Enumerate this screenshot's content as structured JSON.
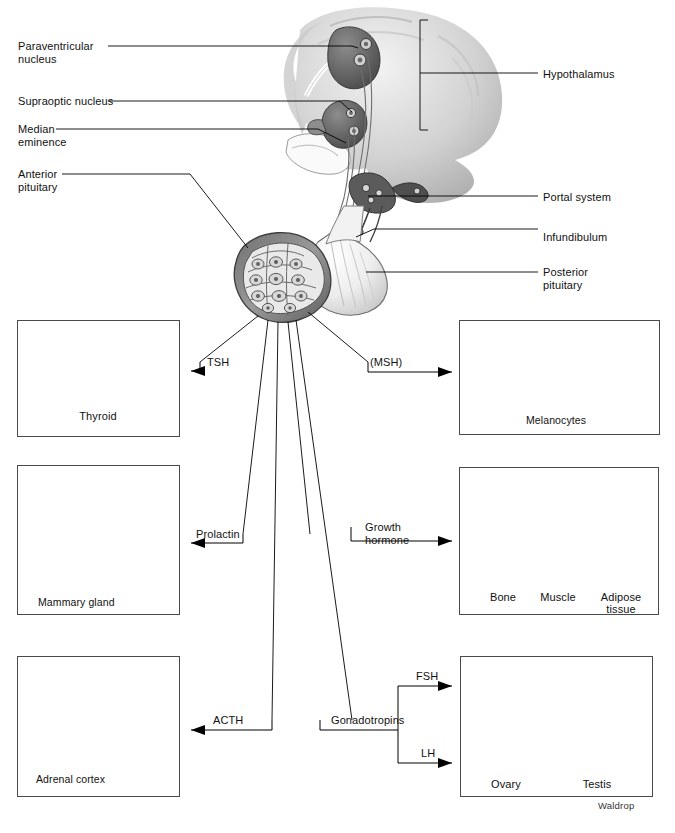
{
  "figure": {
    "credit": "Waldrop"
  },
  "anatomy_labels": {
    "left": [
      {
        "name": "paraventricular-nucleus",
        "text": "Paraventricular\nnucleus",
        "x": 18,
        "y": 40
      },
      {
        "name": "supraoptic-nucleus",
        "text": "Supraoptic nucleus",
        "x": 18,
        "y": 95
      },
      {
        "name": "median-eminence",
        "text": "Median\neminence",
        "x": 18,
        "y": 123
      },
      {
        "name": "anterior-pituitary",
        "text": "Anterior\npituitary",
        "x": 18,
        "y": 168
      }
    ],
    "right": [
      {
        "name": "hypothalamus",
        "text": "Hypothalamus",
        "x": 543,
        "y": 68
      },
      {
        "name": "portal-system",
        "text": "Portal system",
        "x": 543,
        "y": 191
      },
      {
        "name": "infundibulum",
        "text": "Infundibulum",
        "x": 543,
        "y": 231
      },
      {
        "name": "posterior-pituitary",
        "text": "Posterior\npituitary",
        "x": 543,
        "y": 266
      }
    ]
  },
  "hormones": [
    {
      "name": "tsh",
      "label": "TSH",
      "x": 207,
      "y": 356
    },
    {
      "name": "msh",
      "label": "(MSH)",
      "x": 370,
      "y": 356
    },
    {
      "name": "prolactin",
      "label": "Prolactin",
      "x": 196,
      "y": 528
    },
    {
      "name": "growth-hormone",
      "label": "Growth\nhormone",
      "x": 365,
      "y": 521
    },
    {
      "name": "acth",
      "label": "ACTH",
      "x": 213,
      "y": 714
    },
    {
      "name": "gonadotropins",
      "label": "Gonadotropins",
      "x": 331,
      "y": 714
    },
    {
      "name": "fsh",
      "label": "FSH",
      "x": 416,
      "y": 675
    },
    {
      "name": "lh",
      "label": "LH",
      "x": 421,
      "y": 752
    }
  ],
  "panels": [
    {
      "name": "thyroid-panel",
      "x": 17,
      "y": 320,
      "w": 163,
      "h": 117,
      "organs": [
        {
          "label": "Thyroid",
          "x": 98,
          "y": 415
        }
      ],
      "inner_labels": []
    },
    {
      "name": "skin-melanocytes-panel",
      "x": 459,
      "y": 320,
      "w": 201,
      "h": 115,
      "organs": [],
      "inner_labels": [
        {
          "label": "Melanocytes",
          "x": 557,
          "y": 419
        }
      ]
    },
    {
      "name": "mammary-gland-panel",
      "x": 17,
      "y": 465,
      "w": 163,
      "h": 150,
      "organs": [],
      "inner_labels": [
        {
          "label": "Mammary gland",
          "x": 40,
          "y": 601
        }
      ]
    },
    {
      "name": "growth-targets-panel",
      "x": 459,
      "y": 467,
      "w": 200,
      "h": 148,
      "organs": [
        {
          "label": "Bone",
          "x": 502,
          "y": 596
        },
        {
          "label": "Muscle",
          "x": 557,
          "y": 596
        },
        {
          "label": "Adipose tissue",
          "x": 617,
          "y": 596
        }
      ],
      "inner_labels": []
    },
    {
      "name": "adrenal-cortex-panel",
      "x": 17,
      "y": 656,
      "w": 163,
      "h": 141,
      "organs": [],
      "inner_labels": [
        {
          "label": "Adrenal cortex",
          "x": 37,
          "y": 783
        }
      ]
    },
    {
      "name": "gonads-panel",
      "x": 460,
      "y": 656,
      "w": 193,
      "h": 141,
      "organs": [
        {
          "label": "Ovary",
          "x": 506,
          "y": 784
        },
        {
          "label": "Testis",
          "x": 597,
          "y": 784
        }
      ],
      "inner_labels": []
    }
  ]
}
